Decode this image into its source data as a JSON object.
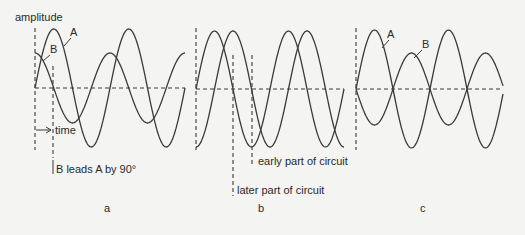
{
  "axis_label": "amplitude",
  "time_label": "time",
  "colors": {
    "ink": "#3a3a3a",
    "background": "#f4f4f2"
  },
  "panels": [
    {
      "id": "a",
      "caption": "a",
      "baseline_y": 88,
      "x_start": 35,
      "x_end": 185,
      "period": 75,
      "waves": [
        {
          "name": "A",
          "amplitude": 59,
          "phase_deg": 0
        },
        {
          "name": "B",
          "amplitude": 35,
          "phase_deg": 90
        }
      ],
      "wave_labels": [
        {
          "text": "A",
          "x": 70,
          "y": 36,
          "leader": [
            71,
            38,
            64,
            46
          ]
        },
        {
          "text": "B",
          "x": 50,
          "y": 53,
          "leader": [
            50,
            55,
            43,
            61
          ]
        }
      ],
      "annotation": "B leads A by 90°"
    },
    {
      "id": "b",
      "caption": "b",
      "baseline_y": 89,
      "x_start": 196,
      "x_end": 344,
      "period": 74,
      "waves": [
        {
          "name": "early",
          "amplitude": 58,
          "phase_deg": 0
        },
        {
          "name": "later",
          "amplitude": 58,
          "phase_deg": -90
        }
      ],
      "annotations": [
        {
          "text": "early part of circuit"
        },
        {
          "text": "later part of circuit"
        }
      ]
    },
    {
      "id": "c",
      "caption": "c",
      "baseline_y": 89,
      "x_start": 356,
      "x_end": 503,
      "period": 74,
      "waves": [
        {
          "name": "A",
          "amplitude": 59,
          "phase_deg": 0
        },
        {
          "name": "B",
          "amplitude": 36,
          "phase_deg": 180
        }
      ],
      "wave_labels": [
        {
          "text": "A",
          "x": 387,
          "y": 38,
          "leader": [
            389,
            40,
            382,
            48
          ]
        },
        {
          "text": "B",
          "x": 422,
          "y": 48,
          "leader": [
            422,
            50,
            414,
            58
          ]
        }
      ]
    }
  ]
}
